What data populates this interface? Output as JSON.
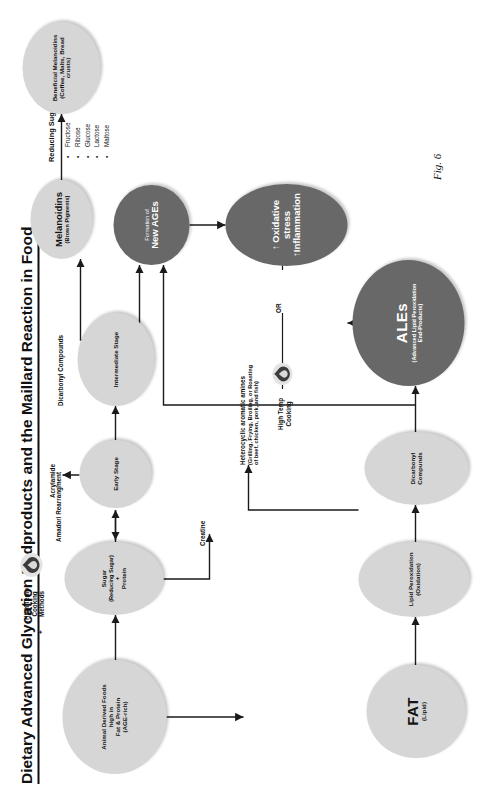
{
  "figure": {
    "title": "Dietary Advanced Glycation Endproducts and the Maillard Reaction in Food",
    "fig_label": "Fig. 6"
  },
  "sidebar": {
    "sugars_heading": "Reducing Sugars:",
    "sugars": [
      "Fructose",
      "Ribose",
      "Glucose",
      "Lactose",
      "Maltose"
    ],
    "bullet": "•"
  },
  "nodes": {
    "animal_foods": {
      "line1": "Animal Derived Foods",
      "line2": "high in",
      "line3": "Fat & Protein",
      "line4": "(AGE-rich)"
    },
    "sugar_protein": {
      "line1": "Sugar",
      "line2": "(Reducing Sugar)",
      "line3": "+",
      "line4": "Protein"
    },
    "early_stage": {
      "line1": "Early Stage"
    },
    "intermediate_stage": {
      "line1": "Intermediate Stage"
    },
    "new_ages": {
      "line1": "Formation of",
      "line2": "New AGEs"
    },
    "melanoidins": {
      "line1": "Melanoidins",
      "line2": "(Brown Pigments)"
    },
    "beneficial_melanoidins": {
      "line1": "Beneficial Melanoidins",
      "line2": "(Coffee, Malts, Bread",
      "line3": "crusts)"
    },
    "oxidative_stress": {
      "line1": "↑ Oxidative",
      "line2": "stress",
      "line3": "↑Inflammation"
    },
    "fat": {
      "line1": "FAT",
      "line2": "(Lipid)"
    },
    "lipid_peroxidation": {
      "line1": "Lipid Peroxidation",
      "line2": "(Oxidation)"
    },
    "dicarbonyl_compounds_node": {
      "line1": "Dicarbonyl",
      "line2": "Compunds"
    },
    "ales": {
      "line1": "ALEs",
      "line2": "(Advanced Lipid Peroxidation",
      "line3": "End-Products)"
    }
  },
  "labels": {
    "high_temp_cooking_methods": {
      "line1": "High Temp",
      "line2": "Cooking",
      "line3": "Methods"
    },
    "plus_sign": "+",
    "amadori": "Amadori Rearrangment",
    "acrylamide": "Acrylamide",
    "dicarbonyl_compounds": "Dicarbonyl Compounds",
    "creatine": "Creatine",
    "heterocyclic_title": "Heterocyclic aromatic amines",
    "heterocyclic_sub1": "(Grilling, Frying, Broiling, or Roasting",
    "heterocyclic_sub2": "of beef, chicken, pork, and fish)",
    "high_temp_cooking": {
      "line1": "High Temp",
      "line2": "Cooking"
    },
    "or": "OR"
  },
  "colors": {
    "light_node": "#d6d6d6",
    "dark_node": "#686868",
    "text": "#141414",
    "dark_node_text": "#ffffff"
  }
}
